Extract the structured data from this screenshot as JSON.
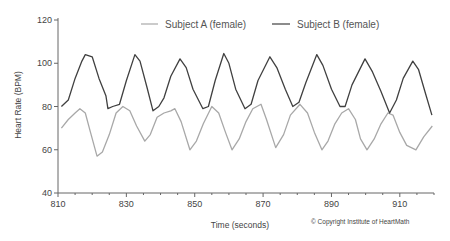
{
  "chart_data": {
    "type": "line",
    "title": "",
    "xlabel": "Time (seconds)",
    "ylabel": "Heart Rate (BPM)",
    "xlim": [
      810,
      920
    ],
    "ylim": [
      40,
      120
    ],
    "x_ticks": [
      810,
      830,
      850,
      870,
      890,
      910
    ],
    "y_ticks": [
      40,
      60,
      80,
      100,
      120
    ],
    "grid": false,
    "legend_position": "top",
    "annotation": "© Copyright Institute of HeartMath",
    "series": [
      {
        "name": "Subject A (female)",
        "color": "#a8a8a8",
        "points": [
          [
            811,
            70
          ],
          [
            813,
            74
          ],
          [
            815,
            77
          ],
          [
            816.4,
            79
          ],
          [
            818,
            77
          ],
          [
            819.5,
            68
          ],
          [
            821.4,
            57
          ],
          [
            823,
            59
          ],
          [
            825,
            67
          ],
          [
            827,
            77
          ],
          [
            829,
            80
          ],
          [
            831,
            78
          ],
          [
            833,
            71
          ],
          [
            835.4,
            64
          ],
          [
            837,
            67
          ],
          [
            839,
            75
          ],
          [
            841,
            77
          ],
          [
            843,
            78
          ],
          [
            844.2,
            79
          ],
          [
            846,
            73
          ],
          [
            848.6,
            60
          ],
          [
            850.5,
            64
          ],
          [
            852.5,
            72
          ],
          [
            855,
            80
          ],
          [
            857,
            77
          ],
          [
            859,
            68
          ],
          [
            860.9,
            60
          ],
          [
            863,
            65
          ],
          [
            865,
            73
          ],
          [
            867,
            79
          ],
          [
            869.4,
            81
          ],
          [
            871,
            74
          ],
          [
            873.7,
            61
          ],
          [
            876,
            67
          ],
          [
            878,
            76
          ],
          [
            880.8,
            81
          ],
          [
            883,
            77
          ],
          [
            885,
            68
          ],
          [
            887.2,
            60
          ],
          [
            889,
            64
          ],
          [
            891,
            72
          ],
          [
            893,
            77
          ],
          [
            895,
            79
          ],
          [
            897,
            74
          ],
          [
            898.5,
            65
          ],
          [
            900.4,
            60
          ],
          [
            902.5,
            65
          ],
          [
            904.5,
            72
          ],
          [
            906.5,
            77
          ],
          [
            908,
            76
          ],
          [
            910,
            68
          ],
          [
            912,
            62
          ],
          [
            914.7,
            60
          ],
          [
            917,
            66
          ],
          [
            919.5,
            71
          ]
        ]
      },
      {
        "name": "Subject B (female)",
        "color": "#404040",
        "points": [
          [
            811,
            80
          ],
          [
            813,
            83
          ],
          [
            815,
            93
          ],
          [
            817,
            101
          ],
          [
            818,
            104
          ],
          [
            820,
            103
          ],
          [
            822,
            93
          ],
          [
            824,
            85
          ],
          [
            824.6,
            79
          ],
          [
            826,
            80
          ],
          [
            828,
            81
          ],
          [
            830,
            92
          ],
          [
            832.5,
            104
          ],
          [
            834,
            101
          ],
          [
            836,
            89
          ],
          [
            837.8,
            78
          ],
          [
            839.5,
            80
          ],
          [
            841,
            84
          ],
          [
            843,
            94
          ],
          [
            845.7,
            102
          ],
          [
            847.5,
            98
          ],
          [
            849.5,
            88
          ],
          [
            852.4,
            79
          ],
          [
            854,
            80
          ],
          [
            856,
            92
          ],
          [
            858.5,
            104.5
          ],
          [
            860,
            100
          ],
          [
            862,
            88
          ],
          [
            864.7,
            79
          ],
          [
            866.5,
            81
          ],
          [
            868.5,
            92
          ],
          [
            872,
            103
          ],
          [
            874,
            98
          ],
          [
            876.5,
            88
          ],
          [
            878.7,
            80
          ],
          [
            880.5,
            82
          ],
          [
            882.5,
            91
          ],
          [
            885.7,
            104
          ],
          [
            887.5,
            99
          ],
          [
            890,
            88
          ],
          [
            892.5,
            80
          ],
          [
            894,
            80
          ],
          [
            896,
            90
          ],
          [
            899.8,
            102
          ],
          [
            902,
            96
          ],
          [
            904.5,
            87
          ],
          [
            907,
            77
          ],
          [
            909,
            83
          ],
          [
            911,
            93
          ],
          [
            913.8,
            101
          ],
          [
            915.5,
            97
          ],
          [
            917.5,
            86
          ],
          [
            919.4,
            76
          ]
        ]
      }
    ]
  },
  "legend": {
    "subject_a": "Subject A (female)",
    "subject_b": "Subject B (female)"
  },
  "axes": {
    "x_title": "Time (seconds)",
    "y_title": "Heart Rate (BPM)",
    "x_tick_labels": [
      "810",
      "830",
      "850",
      "870",
      "890",
      "910"
    ],
    "y_tick_labels": [
      "40",
      "60",
      "80",
      "100",
      "120"
    ]
  },
  "footer": {
    "copyright": "© Copyright Institute of HeartMath"
  }
}
